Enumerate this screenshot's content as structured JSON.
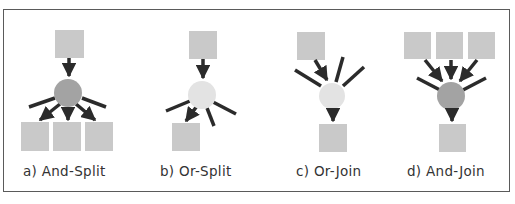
{
  "figure": {
    "colors": {
      "task_square": "#c9c9c9",
      "and_node": "#a3a3a3",
      "or_node": "#e3e3e3",
      "arrow": "#2b2b2b",
      "frame_border": "#5a5a5a"
    },
    "panels": [
      {
        "id": "a",
        "label": "a)  And-Split",
        "node_type": "and",
        "pattern": "split",
        "inputs": 1,
        "outputs": 3
      },
      {
        "id": "b",
        "label": "b)  Or-Split",
        "node_type": "or",
        "pattern": "split",
        "inputs": 1,
        "outputs": 1
      },
      {
        "id": "c",
        "label": "c)  Or-Join",
        "node_type": "or",
        "pattern": "join",
        "inputs": 1,
        "outputs": 1
      },
      {
        "id": "d",
        "label": "d)  And-Join",
        "node_type": "and",
        "pattern": "join",
        "inputs": 3,
        "outputs": 1
      }
    ]
  }
}
